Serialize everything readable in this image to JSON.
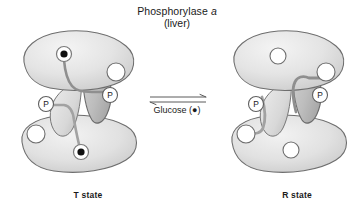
{
  "figure": {
    "title": {
      "enzyme_name": "Phosphorylase",
      "enzyme_form": "a",
      "tissue": "(liver)"
    },
    "background_color": "#ffffff",
    "equilibrium": {
      "reaction_type": "reversible",
      "ligand_label": "Glucose",
      "ligand_symbol": "(●)",
      "arrow_direction": "double-headed"
    },
    "states": [
      {
        "id": "t-state",
        "label": "T state",
        "position": "left",
        "description": "Phosphorylase a dimer in tense conformation; glucose bound at both active sites",
        "subunits": [
          {
            "id": "t-upper-subunit",
            "glucose_bound": true,
            "glucose_marker": "filled-dot",
            "empty_site": true,
            "phosphoserine_label": "P"
          },
          {
            "id": "t-lower-subunit",
            "glucose_bound": true,
            "glucose_marker": "filled-dot",
            "empty_site": true,
            "phosphoserine_label": "P"
          }
        ]
      },
      {
        "id": "r-state",
        "label": "R state",
        "position": "right",
        "description": "Phosphorylase a dimer in relaxed conformation; active sites unoccupied",
        "subunits": [
          {
            "id": "r-upper-subunit",
            "glucose_bound": false,
            "glucose_marker": "open-circle",
            "empty_site": true,
            "phosphoserine_label": "P"
          },
          {
            "id": "r-lower-subunit",
            "glucose_bound": false,
            "glucose_marker": "open-circle",
            "empty_site": true,
            "phosphoserine_label": "P"
          }
        ]
      }
    ],
    "colors": {
      "lobe_fill_light": "#ececec",
      "lobe_fill_mid": "#dcdcdc",
      "lobe_fill_dark": "#c9c9c9",
      "tail_fill": "#b9b9b9",
      "outline": "#6e6e6e",
      "chain": "#8a8a8a",
      "glucose_dot": "#111111",
      "site_fill": "#ffffff",
      "text": "#1a1a1a"
    }
  }
}
